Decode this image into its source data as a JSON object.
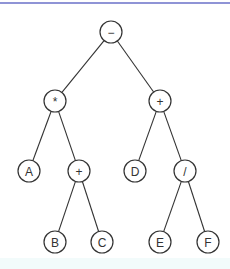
{
  "diagram": {
    "type": "expression-tree",
    "colors": {
      "stroke": "#333333",
      "top_rule": "#8f94d6",
      "bottom_band": "#f2fbfb"
    },
    "nodes": [
      {
        "id": "n0",
        "label": "−",
        "x": 111,
        "y": 32
      },
      {
        "id": "n1",
        "label": "*",
        "x": 55,
        "y": 101
      },
      {
        "id": "n2",
        "label": "+",
        "x": 160,
        "y": 101
      },
      {
        "id": "n3",
        "label": "A",
        "x": 29,
        "y": 171
      },
      {
        "id": "n4",
        "label": "+",
        "x": 79,
        "y": 171
      },
      {
        "id": "n5",
        "label": "D",
        "x": 135,
        "y": 171
      },
      {
        "id": "n6",
        "label": "/",
        "x": 185,
        "y": 171
      },
      {
        "id": "n7",
        "label": "B",
        "x": 55,
        "y": 242
      },
      {
        "id": "n8",
        "label": "C",
        "x": 102,
        "y": 242
      },
      {
        "id": "n9",
        "label": "E",
        "x": 160,
        "y": 242
      },
      {
        "id": "n10",
        "label": "F",
        "x": 208,
        "y": 242
      }
    ],
    "edges": [
      [
        "n0",
        "n1"
      ],
      [
        "n0",
        "n2"
      ],
      [
        "n1",
        "n3"
      ],
      [
        "n1",
        "n4"
      ],
      [
        "n2",
        "n5"
      ],
      [
        "n2",
        "n6"
      ],
      [
        "n4",
        "n7"
      ],
      [
        "n4",
        "n8"
      ],
      [
        "n6",
        "n9"
      ],
      [
        "n6",
        "n10"
      ]
    ],
    "node_radius": 11
  }
}
